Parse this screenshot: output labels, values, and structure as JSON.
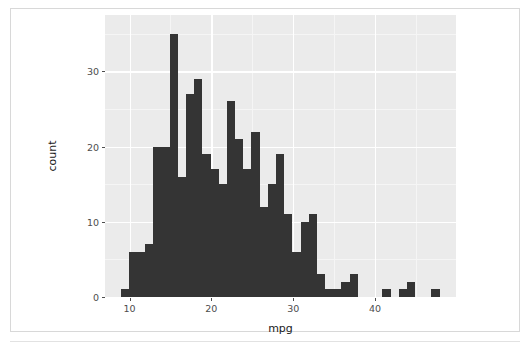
{
  "figure": {
    "background_color": "#ffffff",
    "panel_background_color": "#ebebeb",
    "grid_major_color": "#ffffff",
    "grid_minor_color": "#f5f5f5",
    "bar_fill_color": "#343434",
    "axis_text_color": "#4d4d4d",
    "axis_title_color": "#1a1a1a",
    "frame_border_color": "#d8d8d8"
  },
  "chart_data": {
    "type": "bar",
    "subtype": "histogram",
    "title": "",
    "subtitle": "",
    "xlabel": "mpg",
    "ylabel": "count",
    "xlim": [
      7.0,
      49.9
    ],
    "ylim": [
      0,
      37.5
    ],
    "grid": true,
    "legend": "none",
    "x_ticks": [
      10,
      20,
      30,
      40
    ],
    "x_tick_labels": [
      "10",
      "20",
      "30",
      "40"
    ],
    "y_ticks": [
      0,
      10,
      20,
      30
    ],
    "y_tick_labels": [
      "0",
      "10",
      "20",
      "30"
    ],
    "x_minor_ticks": [
      5,
      15,
      25,
      35,
      45
    ],
    "y_minor_ticks": [
      5,
      15,
      25,
      35
    ],
    "bin_width": 1.0,
    "bin_starts": [
      8.9,
      9.9,
      10.9,
      11.9,
      12.9,
      13.9,
      14.9,
      15.9,
      16.9,
      17.9,
      18.9,
      19.9,
      20.9,
      21.9,
      22.9,
      23.9,
      24.9,
      25.9,
      26.9,
      27.9,
      28.9,
      29.9,
      30.9,
      31.9,
      32.9,
      33.9,
      34.9,
      35.9,
      36.9,
      37.9,
      40.9,
      42.9,
      43.9,
      46.9
    ],
    "values": [
      1,
      6,
      6,
      7,
      20,
      20,
      35,
      16,
      27,
      29,
      19,
      17,
      15,
      26,
      21,
      17,
      22,
      12,
      15,
      19,
      11,
      6,
      10,
      11,
      3,
      1,
      1,
      2,
      3,
      0,
      1,
      1,
      2,
      1
    ],
    "bar_count": 34,
    "max_count": 35,
    "annotations": []
  }
}
